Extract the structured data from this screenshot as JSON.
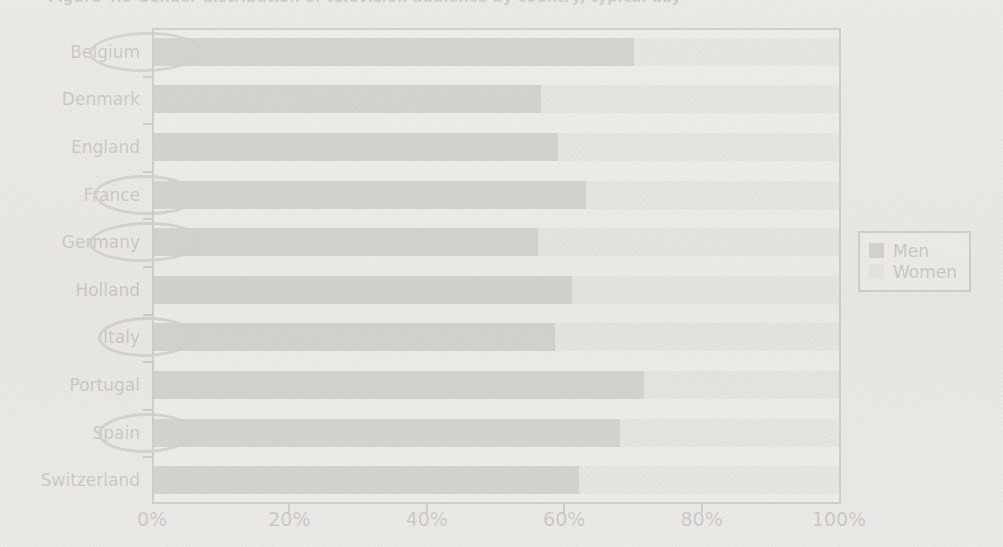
{
  "figure": {
    "title": "Figure 4.5  Gender distribution of television audience by country, typical day",
    "title_truncated": true
  },
  "legend": {
    "position": "right",
    "items": [
      {
        "label": "Men",
        "color": "#595959"
      },
      {
        "label": "Women",
        "color": "#cdcdcd"
      }
    ]
  },
  "axis": {
    "x_ticks": [
      "0%",
      "20%",
      "40%",
      "60%",
      "80%",
      "100%"
    ]
  },
  "annotations": {
    "style": "hand-drawn-ellipse",
    "color": "#4d4d4d",
    "circled_categories": [
      "Belgium",
      "France",
      "Germany",
      "Italy",
      "Spain"
    ]
  },
  "chart_data": {
    "type": "bar",
    "orientation": "horizontal",
    "stacked": true,
    "normalized": true,
    "title": "Figure 4.5  Gender distribution of television audience by country, typical day",
    "xlabel": "",
    "ylabel": "",
    "xlim": [
      0,
      100
    ],
    "grid": false,
    "legend_position": "right",
    "categories": [
      "Belgium",
      "Denmark",
      "England",
      "France",
      "Germany",
      "Holland",
      "Italy",
      "Portugal",
      "Spain",
      "Switzerland"
    ],
    "series": [
      {
        "name": "Men",
        "color": "#595959",
        "values": [
          70,
          56.5,
          59,
          63,
          56,
          61,
          58.5,
          71.5,
          68,
          62
        ]
      },
      {
        "name": "Women",
        "color": "#cdcdcd",
        "values": [
          30,
          43.5,
          41,
          37,
          44,
          39,
          41.5,
          28.5,
          32,
          38
        ]
      }
    ]
  }
}
